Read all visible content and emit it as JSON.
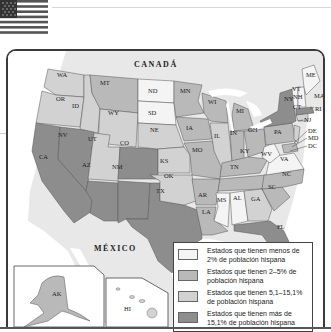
{
  "map": {
    "country_labels": {
      "north": "CANADÁ",
      "south": "MÉXICO"
    },
    "colors": {
      "lt2": "#f4f4f4",
      "r2to5": "#b9b9b9",
      "r5to15": "#d2d2d2",
      "gt15": "#8d8d8d",
      "water": "#ffffff",
      "land_other": "#e4e4e4"
    },
    "states": {
      "WA": "5.1-15.1%",
      "OR": "5.1-15.1%",
      "CA": ">15.1%",
      "NV": ">15.1%",
      "ID": "5.1-15.1%",
      "MT": "2-5%",
      "WY": "5.1-15.1%",
      "UT": "5.1-15.1%",
      "CO": ">15.1%",
      "AZ": ">15.1%",
      "NM": ">15.1%",
      "TX": ">15.1%",
      "ND": "<2%",
      "SD": "<2%",
      "NE": "5.1-15.1%",
      "KS": "5.1-15.1%",
      "OK": "5.1-15.1%",
      "MN": "2-5%",
      "IA": "2-5%",
      "MO": "2-5%",
      "AR": "2-5%",
      "LA": "2-5%",
      "WI": "2-5%",
      "IL": "5.1-15.1%",
      "MI": "2-5%",
      "IN": "2-5%",
      "OH": "2-5%",
      "KY": "2-5%",
      "TN": "2-5%",
      "MS": "<2%",
      "AL": "<2%",
      "GA": "5.1-15.1%",
      "FL": ">15.1%",
      "SC": "2-5%",
      "NC": "2-5%",
      "VA": "<2%",
      "WV": "<2%",
      "PA": "2-5%",
      "NY": ">15.1%",
      "VT": "<2%",
      "NH": "<2%",
      "ME": "<2%",
      "MA": "5.1-15.1%",
      "RI": "5.1-15.1%",
      "CT": "5.1-15.1%",
      "NJ": "5.1-15.1%",
      "DE": "2-5%",
      "MD": "2-5%",
      "DC": "5.1-15.1%",
      "AK": "2-5%",
      "HI": "5.1-15.1%"
    }
  },
  "legend": {
    "items": [
      {
        "label": "Estados que tienen menos de 2% de población hispana",
        "color": "#f4f4f4"
      },
      {
        "label": "Estados que tienen 2–5% de población hispana",
        "color": "#b9b9b9"
      },
      {
        "label": "Estados que tienen 5,1–15,1% de población hispana",
        "color": "#d2d2d2"
      },
      {
        "label": "Estados que tienen más de 15,1% de población hispana",
        "color": "#8d8d8d"
      }
    ]
  }
}
